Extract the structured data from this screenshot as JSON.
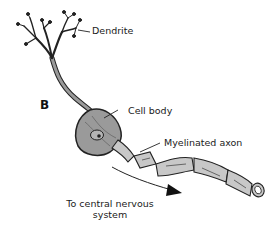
{
  "diagram": {
    "panel_letter": "B",
    "labels": {
      "dendrite": "Dendrite",
      "cell_body": "Cell body",
      "myelinated_axon": "Myelinated axon",
      "direction_line1": "To central nervous",
      "direction_line2": "system"
    },
    "colors": {
      "fill": "#9a9a9a",
      "fill_light": "#c8c8c8",
      "outline": "#222222",
      "text": "#1a1a1a"
    }
  }
}
